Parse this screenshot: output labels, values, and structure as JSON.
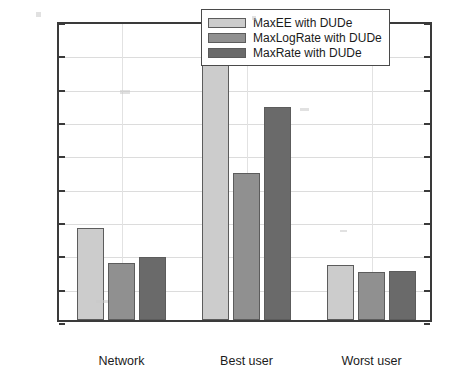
{
  "chart_data": {
    "type": "bar",
    "title": "",
    "xlabel": "",
    "ylabel": "Energy efficiency(Mbits/Hz/Joule)",
    "categories": [
      "Network",
      "Best user",
      "Worst user"
    ],
    "series": [
      {
        "name": "MaxEE with DUDe",
        "color": "#cccccc",
        "values": [
          2.75,
          8.1,
          1.65
        ]
      },
      {
        "name": "MaxLogRate with DUDe",
        "color": "#909090",
        "values": [
          1.7,
          4.42,
          1.45
        ]
      },
      {
        "name": "MaxRate with DUDe",
        "color": "#6a6a6a",
        "values": [
          1.88,
          6.4,
          1.48
        ]
      }
    ],
    "ylim": [
      0,
      9
    ],
    "yticks": [
      "0",
      "1",
      "2",
      "3",
      "4",
      "5",
      "6",
      "7",
      "8",
      "9"
    ],
    "grid": true,
    "legend_position": "top-right"
  }
}
